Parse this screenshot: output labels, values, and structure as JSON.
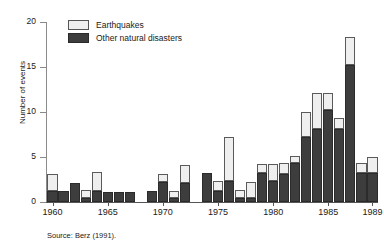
{
  "chart_data": {
    "type": "bar",
    "title": "",
    "subtitle": "",
    "xlabel": "",
    "ylabel": "Number of events",
    "stacked": true,
    "grid": false,
    "legend_position": "top-left",
    "ylim": [
      0,
      20
    ],
    "yticks": [
      0,
      5,
      10,
      15,
      20
    ],
    "xticks": [
      1960,
      1965,
      1970,
      1975,
      1980,
      1985,
      1989
    ],
    "categories": [
      1960,
      1961,
      1962,
      1963,
      1964,
      1965,
      1966,
      1967,
      1968,
      1969,
      1970,
      1971,
      1972,
      1973,
      1974,
      1975,
      1976,
      1977,
      1978,
      1979,
      1980,
      1981,
      1982,
      1983,
      1984,
      1985,
      1986,
      1987,
      1988,
      1989
    ],
    "series": [
      {
        "name": "Other natural disasters",
        "color": "#3d3d3d",
        "values": [
          1.2,
          1.2,
          2.1,
          0.4,
          1.2,
          1.1,
          1.1,
          1.1,
          0,
          1.2,
          2.2,
          0.4,
          2.1,
          0,
          3.2,
          1.2,
          2.3,
          0.5,
          0.4,
          3.2,
          2.3,
          3.1,
          4.3,
          7.2,
          8.1,
          10.2,
          8.1,
          15.2,
          3.2,
          3.2
        ]
      },
      {
        "name": "Earthquakes",
        "color": "#efefef",
        "values": [
          1.9,
          0,
          0,
          0.9,
          2.1,
          0,
          0,
          0,
          0,
          0,
          0.9,
          0.8,
          2.0,
          0,
          0,
          1.1,
          4.9,
          0.8,
          1.8,
          1.0,
          1.9,
          1.2,
          0.8,
          2.8,
          4.0,
          1.9,
          1.2,
          3.1,
          1.1,
          1.8
        ]
      }
    ],
    "totals": [
      3.1,
      1.2,
      2.1,
      1.3,
      3.3,
      1.1,
      1.1,
      1.1,
      0,
      1.2,
      3.1,
      1.2,
      4.1,
      0,
      3.2,
      2.3,
      7.2,
      1.3,
      2.2,
      4.2,
      4.2,
      4.3,
      5.1,
      10.0,
      12.1,
      12.1,
      9.3,
      18.3,
      4.3,
      5.0
    ],
    "source_note": "Source: Berz (1991)."
  },
  "legend": {
    "items": [
      {
        "label": "Earthquakes",
        "swatch": "light"
      },
      {
        "label": "Other natural disasters",
        "swatch": "dark"
      }
    ]
  }
}
